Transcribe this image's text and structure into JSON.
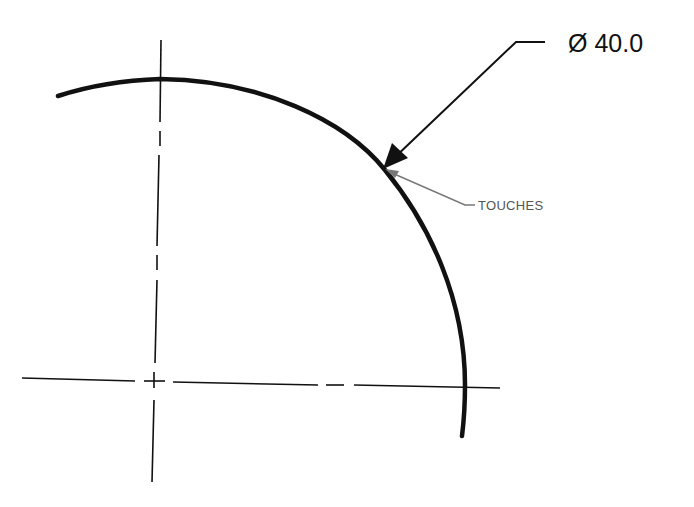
{
  "drawing": {
    "type": "technical-drawing",
    "description": "Quarter arc of a circle with centerlines and diameter dimension leader",
    "dimension": {
      "symbol": "Ø",
      "value": "40.0",
      "label": "Ø 40.0"
    },
    "note": {
      "label": "TOUCHES"
    },
    "colors": {
      "object_line": "#111111",
      "center_line": "#111111",
      "note_leader": "#777777",
      "background": "#ffffff"
    }
  }
}
